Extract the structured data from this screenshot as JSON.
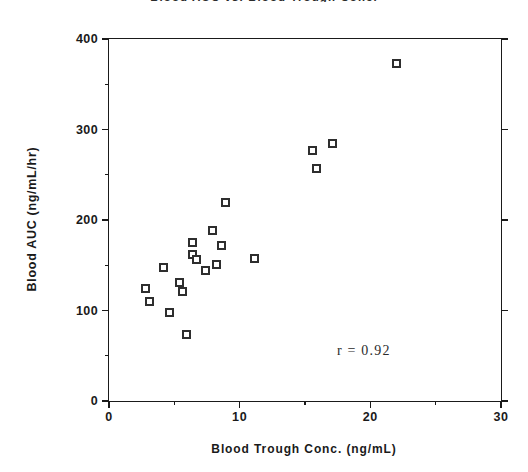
{
  "chart_data": {
    "type": "scatter",
    "title": "Blood AUC vs. Blood Trough Conc.",
    "xlabel": "Blood Trough Conc.  (ng/mL)",
    "ylabel": "Blood  AUC  (ng/mL/hr)",
    "xlim": [
      0,
      30
    ],
    "ylim": [
      0,
      400
    ],
    "xticks": [
      0,
      10,
      20,
      30
    ],
    "xtick_labels": [
      "0",
      "10",
      "20",
      "30"
    ],
    "xminor_ticks": [
      5,
      15,
      25
    ],
    "yticks": [
      0,
      100,
      200,
      300,
      400
    ],
    "ytick_labels": [
      "0",
      "100",
      "200",
      "300",
      "400"
    ],
    "yminor_ticks": [
      50,
      150,
      250,
      350
    ],
    "grid": false,
    "legend": null,
    "marker": "open-square",
    "marker_color": "#2e2e2e",
    "x": [
      2.8,
      3.1,
      4.2,
      4.6,
      5.4,
      5.6,
      5.9,
      6.4,
      6.4,
      6.7,
      7.4,
      7.9,
      8.2,
      8.6,
      8.9,
      11.1,
      15.6,
      15.9,
      17.1,
      22.0
    ],
    "y": [
      124,
      110,
      147,
      98,
      131,
      121,
      74,
      175,
      162,
      156,
      144,
      188,
      151,
      172,
      219,
      158,
      277,
      257,
      284,
      373
    ],
    "points": [
      {
        "x": 2.8,
        "y": 124
      },
      {
        "x": 3.1,
        "y": 110
      },
      {
        "x": 4.2,
        "y": 147
      },
      {
        "x": 4.6,
        "y": 98
      },
      {
        "x": 5.4,
        "y": 131
      },
      {
        "x": 5.6,
        "y": 121
      },
      {
        "x": 5.9,
        "y": 74
      },
      {
        "x": 6.4,
        "y": 175
      },
      {
        "x": 6.4,
        "y": 162
      },
      {
        "x": 6.7,
        "y": 156
      },
      {
        "x": 7.4,
        "y": 144
      },
      {
        "x": 7.9,
        "y": 188
      },
      {
        "x": 8.2,
        "y": 151
      },
      {
        "x": 8.6,
        "y": 172
      },
      {
        "x": 8.9,
        "y": 219
      },
      {
        "x": 11.1,
        "y": 158
      },
      {
        "x": 15.6,
        "y": 277
      },
      {
        "x": 15.9,
        "y": 257
      },
      {
        "x": 17.1,
        "y": 284
      },
      {
        "x": 22.0,
        "y": 373
      }
    ],
    "annotations": [
      {
        "text": "r = 0.92",
        "x": 19.5,
        "y": 55,
        "name": "correlation-annotation"
      }
    ]
  }
}
